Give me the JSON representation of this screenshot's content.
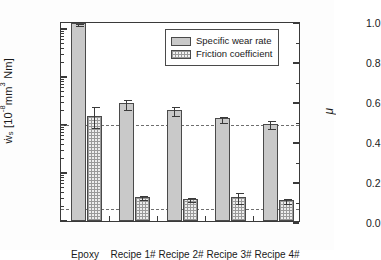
{
  "chart_data": {
    "type": "bar",
    "title": "",
    "xlabel": "",
    "categories": [
      "Epoxy",
      "Recipe 1#",
      "Recipe 2#",
      "Recipe 3#",
      "Recipe 4#"
    ],
    "series": [
      {
        "name": "Specific wear rate",
        "axis": "left",
        "unit": "10^-8 mm^3 / Nm",
        "values": [
          120,
          2.6,
          1.9,
          1.25,
          0.95
        ],
        "errors_low": [
          10,
          0.65,
          0.4,
          0.18,
          0.18
        ],
        "errors_high": [
          10,
          0.75,
          0.45,
          0.2,
          0.25
        ],
        "fill": "solid-gray"
      },
      {
        "name": "Friction coefficient",
        "axis": "right",
        "unit": "",
        "values": [
          0.525,
          0.122,
          0.112,
          0.12,
          0.105
        ],
        "errors_low": [
          0.055,
          0.012,
          0.012,
          0.028,
          0.013
        ],
        "errors_high": [
          0.055,
          0.015,
          0.012,
          0.03,
          0.013
        ],
        "fill": "cross-hatch"
      }
    ],
    "yaxis_left": {
      "label": "ẇs  [10⁻⁸ mm³ Nm]",
      "scale": "log",
      "limits": [
        0.0066,
        210
      ],
      "ticks": [
        {
          "value": 100,
          "label": "100"
        },
        {
          "value": 10,
          "label": "10"
        },
        {
          "value": 1,
          "label": "1"
        },
        {
          "value": 0.1,
          "label": "0.1"
        },
        {
          "value": 0.01,
          "label": "0.01"
        }
      ]
    },
    "yaxis_right": {
      "label": "μ",
      "scale": "linear",
      "limits": [
        0.0,
        1.0
      ],
      "ticks": [
        {
          "value": 1.0,
          "label": "1.0"
        },
        {
          "value": 0.8,
          "label": "0.8"
        },
        {
          "value": 0.6,
          "label": "0.6"
        },
        {
          "value": 0.4,
          "label": "0.4"
        },
        {
          "value": 0.2,
          "label": "0.2"
        },
        {
          "value": 0.0,
          "label": "0.0"
        }
      ]
    },
    "reference_lines": [
      {
        "name": "wear-rate-reference",
        "left_axis_value": 1,
        "right_axis_value": 0.5,
        "style": "dashed"
      },
      {
        "name": "friction-reference",
        "left_axis_value": 0.018,
        "right_axis_value": 0.115,
        "style": "dashed"
      }
    ],
    "legend": {
      "position": "top-right-inside",
      "entries": [
        {
          "label": "Specific wear rate",
          "fill": "solid-gray"
        },
        {
          "label": "Friction coefficient",
          "fill": "cross-hatch"
        }
      ]
    },
    "grid": false,
    "colors": {
      "wear_fill": "#c9c9c9",
      "friction_fill": "#eeeeee",
      "outline": "#4a4a4a",
      "axis": "#3a3a3a",
      "reference_line": "#6f6f6f",
      "background": "#ffffff"
    }
  },
  "axis_title_left": {
    "symbol": "ẇ",
    "sub": "s",
    "bracket_open": "  [10",
    "exp": "-8",
    "unit": "mm",
    "unit_exp": "3",
    "unit_tail": " Nm]"
  },
  "axis_title_right": "μ"
}
